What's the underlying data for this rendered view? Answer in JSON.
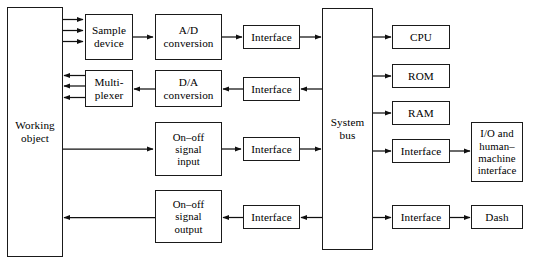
{
  "diagram": {
    "stroke_color": "#1a1a1a",
    "background_color": "#ffffff",
    "blocks": {
      "working_object": "Working\nobject",
      "sample_device": "Sample\ndevice",
      "multiplexer": "Multi-\nplexer",
      "ad_conversion": "A/D\nconversion",
      "da_conversion": "D/A\nconversion",
      "on_off_signal_input": "On–off\nsignal\ninput",
      "on_off_signal_output": "On–off\nsignal\noutput",
      "interface_ad": "Interface",
      "interface_da": "Interface",
      "interface_onoff_in": "Interface",
      "interface_onoff_out": "Interface",
      "system_bus": "System\nbus",
      "cpu": "CPU",
      "rom": "ROM",
      "ram": "RAM",
      "interface_io": "Interface",
      "interface_dash": "Interface",
      "io_human_machine": "I/O and\nhuman–\nmachine\ninterface",
      "dash": "Dash"
    }
  }
}
